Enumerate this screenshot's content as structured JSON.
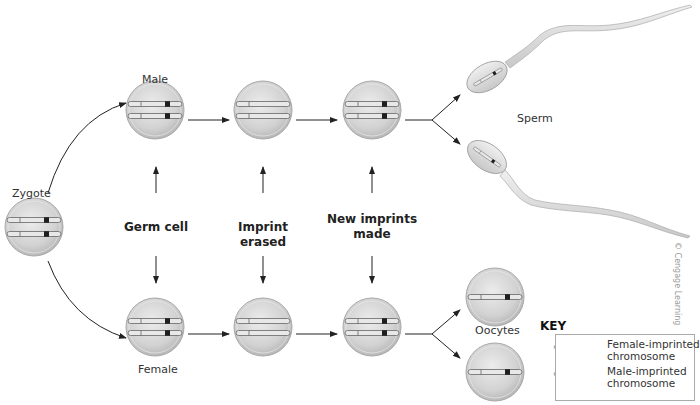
{
  "labels": {
    "zygote": "Zygote",
    "male": "Male",
    "female": "Female",
    "sperm": "Sperm",
    "oocytes": "Oocytes",
    "stage_germ_cell": "Germ cell",
    "stage_imprint_erased": "Imprint erased",
    "stage_new_imprints_line1": "New imprints",
    "stage_new_imprints_line2": "made"
  },
  "key": {
    "title": "KEY",
    "items": [
      {
        "line1": "Female-imprinted",
        "line2": "chromosome",
        "mark_color": "#222222"
      },
      {
        "line1": "Male-imprinted",
        "line2": "chromosome",
        "mark_color": "#222222"
      }
    ]
  },
  "credit": "© Cengage Learning",
  "colors": {
    "cell_fill": "#d4d4d4",
    "cell_edge": "#a8a8a8",
    "chromosome_fill": "#e6e6e6",
    "imprint_mark": "#1e1e1e",
    "arrow": "#222222",
    "sperm_fill": "#dcdcdc"
  }
}
